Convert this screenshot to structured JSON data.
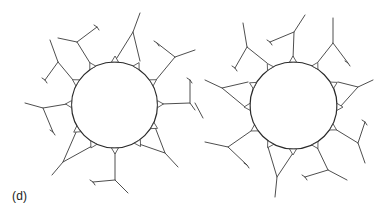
{
  "figure": {
    "panel_label": "(d)",
    "line_color": "#3a3a3a",
    "background": "#ffffff",
    "structures": [
      {
        "name": "left-structure",
        "center": [
          114.5,
          105
        ],
        "radius": 43,
        "anchors": [
          [
            90,
            63
          ],
          [
            115,
            61
          ],
          [
            140,
            61
          ],
          [
            73,
            80
          ],
          [
            156,
            80
          ],
          [
            67,
            104
          ],
          [
            162,
            104
          ],
          [
            77,
            130
          ],
          [
            155,
            127
          ],
          [
            92,
            146
          ],
          [
            115,
            152
          ],
          [
            139,
            144
          ]
        ],
        "branches": [
          [
            [
              73,
              80
            ],
            [
              58,
              62
            ],
            [
              50,
              40
            ]
          ],
          [
            [
              58,
              62
            ],
            [
              45,
              80
            ]
          ],
          [
            [
              90,
              63
            ],
            [
              77,
              42
            ],
            [
              58,
              38
            ]
          ],
          [
            [
              77,
              42
            ],
            [
              97,
              27
            ]
          ],
          [
            [
              115,
              61
            ],
            [
              133,
              32
            ],
            [
              140,
              13
            ]
          ],
          [
            [
              133,
              32
            ],
            [
              140,
              61
            ]
          ],
          [
            [
              156,
              80
            ],
            [
              175,
              57
            ],
            [
              195,
              50
            ]
          ],
          [
            [
              175,
              57
            ],
            [
              157,
              43
            ]
          ],
          [
            [
              162,
              104
            ],
            [
              190,
              103
            ],
            [
              195,
              110
            ]
          ],
          [
            [
              190,
              103
            ],
            [
              190,
              80
            ]
          ],
          [
            [
              67,
              104
            ],
            [
              43,
              108
            ],
            [
              25,
              103
            ]
          ],
          [
            [
              43,
              108
            ],
            [
              53,
              132
            ]
          ],
          [
            [
              77,
              130
            ],
            [
              63,
              162
            ],
            [
              52,
              175
            ]
          ],
          [
            [
              63,
              162
            ],
            [
              92,
              146
            ]
          ],
          [
            [
              115,
              152
            ],
            [
              115,
              180
            ],
            [
              128,
              193
            ]
          ],
          [
            [
              115,
              180
            ],
            [
              93,
              182
            ]
          ],
          [
            [
              155,
              127
            ],
            [
              165,
              153
            ],
            [
              178,
              167
            ]
          ],
          [
            [
              165,
              153
            ],
            [
              139,
              144
            ]
          ]
        ],
        "forks": [
          [
            45,
            80
          ],
          [
            97,
            27
          ],
          [
            157,
            43
          ],
          [
            190,
            80
          ],
          [
            53,
            132
          ],
          [
            93,
            182
          ]
        ]
      },
      {
        "name": "right-structure",
        "center": [
          293.5,
          105.5
        ],
        "radius": 43.5,
        "anchors": [
          [
            293,
            59
          ],
          [
            267,
            63
          ],
          [
            318,
            62
          ],
          [
            338,
            82
          ],
          [
            340,
            107
          ],
          [
            248,
            82
          ],
          [
            245,
            107
          ],
          [
            251,
            131
          ],
          [
            268,
            147
          ],
          [
            293,
            153
          ],
          [
            335,
            129
          ],
          [
            317,
            147
          ]
        ],
        "branches": [
          [
            [
              293,
              59
            ],
            [
              294,
              32
            ],
            [
              305,
              15
            ]
          ],
          [
            [
              294,
              32
            ],
            [
              270,
              42
            ]
          ],
          [
            [
              267,
              63
            ],
            [
              247,
              47
            ],
            [
              243,
              23
            ]
          ],
          [
            [
              247,
              47
            ],
            [
              235,
              68
            ]
          ],
          [
            [
              318,
              62
            ],
            [
              333,
              43
            ],
            [
              333,
              18
            ]
          ],
          [
            [
              333,
              43
            ],
            [
              348,
              63
            ]
          ],
          [
            [
              338,
              82
            ],
            [
              358,
              87
            ],
            [
              373,
              80
            ]
          ],
          [
            [
              358,
              87
            ],
            [
              340,
              107
            ]
          ],
          [
            [
              248,
              82
            ],
            [
              222,
              88
            ],
            [
              205,
              80
            ]
          ],
          [
            [
              222,
              88
            ],
            [
              245,
              107
            ]
          ],
          [
            [
              195,
              103
            ],
            [
              203,
              118
            ]
          ],
          [
            [
              251,
              131
            ],
            [
              228,
              147
            ],
            [
              205,
              142
            ]
          ],
          [
            [
              228,
              147
            ],
            [
              247,
              165
            ]
          ],
          [
            [
              268,
              147
            ],
            [
              277,
              177
            ],
            [
              275,
              197
            ]
          ],
          [
            [
              277,
              177
            ],
            [
              293,
              153
            ]
          ],
          [
            [
              335,
              129
            ],
            [
              358,
              143
            ],
            [
              365,
              163
            ]
          ],
          [
            [
              358,
              143
            ],
            [
              365,
              122
            ]
          ],
          [
            [
              317,
              147
            ],
            [
              328,
              170
            ],
            [
              347,
              180
            ]
          ],
          [
            [
              328,
              170
            ],
            [
              305,
              177
            ]
          ]
        ],
        "forks": [
          [
            270,
            42
          ],
          [
            235,
            68
          ],
          [
            348,
            63
          ],
          [
            247,
            165
          ],
          [
            365,
            122
          ],
          [
            305,
            177
          ]
        ]
      }
    ]
  }
}
